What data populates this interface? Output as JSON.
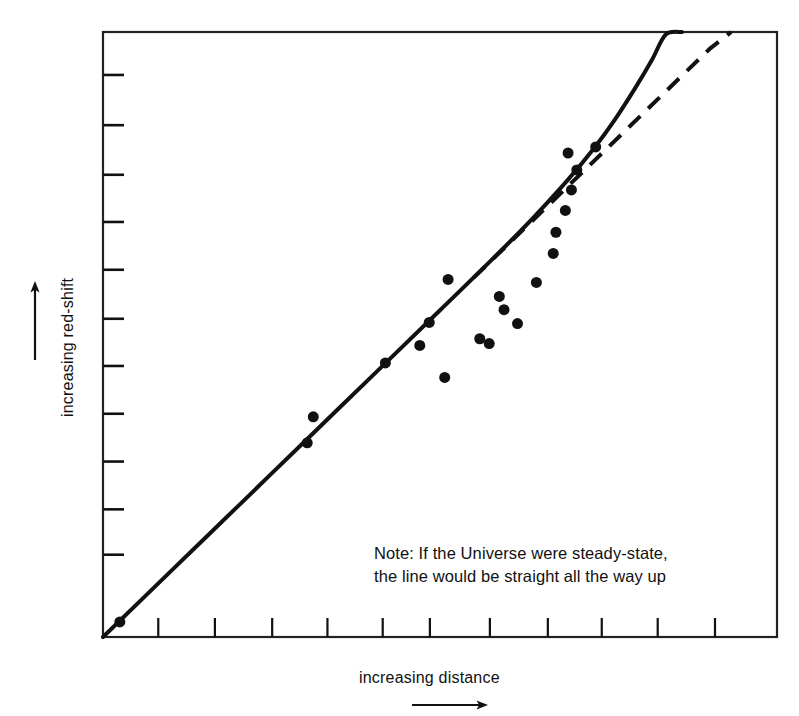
{
  "chart_data": {
    "type": "scatter",
    "title": "",
    "subtitle": "",
    "xlabel": "increasing distance",
    "ylabel": "increasing red-shift",
    "xtick_labels": [],
    "ytick_labels": [],
    "grid": false,
    "legend": null,
    "axis_note": "Axes are unlabeled/qualitative: only direction of increase is indicated by arrows.",
    "xlim": [
      0,
      100
    ],
    "ylim": [
      0,
      100
    ],
    "x_tick_count": 11,
    "y_tick_count": 11,
    "x_tick_positions": [
      8.2,
      16.6,
      25.1,
      33.3,
      41.5,
      48.5,
      57.4,
      66.0,
      74.0,
      82.3,
      90.8
    ],
    "y_tick_positions": [
      92.9,
      84.6,
      76.4,
      68.6,
      60.7,
      52.6,
      44.8,
      36.9,
      29.0,
      21.1,
      13.6
    ],
    "annotations": [
      {
        "name": "steady-state-note",
        "line1": "Note: If the Universe were steady-state,",
        "line2": "the line would be straight all the way up",
        "x": 41.0,
        "y": 15.0
      }
    ],
    "series": [
      {
        "name": "observed-galaxies",
        "type": "scatter",
        "marker": "filled-circle",
        "marker_size_px": 11,
        "color": "#111111",
        "points": [
          [
            2.5,
            2.5
          ],
          [
            30.3,
            32.1
          ],
          [
            31.2,
            36.4
          ],
          [
            41.9,
            45.3
          ],
          [
            48.4,
            52.0
          ],
          [
            47.0,
            48.2
          ],
          [
            50.7,
            42.9
          ],
          [
            51.2,
            59.1
          ],
          [
            55.9,
            49.3
          ],
          [
            57.3,
            48.5
          ],
          [
            58.8,
            56.3
          ],
          [
            59.5,
            54.1
          ],
          [
            61.5,
            51.8
          ],
          [
            64.3,
            58.6
          ],
          [
            67.2,
            66.9
          ],
          [
            68.6,
            70.5
          ],
          [
            69.5,
            73.9
          ],
          [
            70.3,
            77.2
          ],
          [
            69.0,
            80.0
          ],
          [
            73.1,
            81.0
          ],
          [
            66.8,
            63.4
          ]
        ]
      },
      {
        "name": "observed-curve-decelerating",
        "type": "line",
        "style": "solid",
        "color": "#111111",
        "width_px": 4,
        "description": "Observed relation: bends upward away from a straight line at large distance",
        "points": [
          [
            0.0,
            0.0
          ],
          [
            10.0,
            10.8
          ],
          [
            20.0,
            21.6
          ],
          [
            30.0,
            32.4
          ],
          [
            40.0,
            43.2
          ],
          [
            50.0,
            54.0
          ],
          [
            58.0,
            62.7
          ],
          [
            64.0,
            69.5
          ],
          [
            69.0,
            75.6
          ],
          [
            73.0,
            81.0
          ],
          [
            76.0,
            85.6
          ],
          [
            79.0,
            90.8
          ],
          [
            81.5,
            95.5
          ],
          [
            83.5,
            99.6
          ],
          [
            85.9,
            100.0
          ]
        ]
      },
      {
        "name": "steady-state-line-straight",
        "type": "line",
        "style": "dashed",
        "color": "#111111",
        "width_px": 4,
        "dash_pattern": "16 11",
        "description": "Straight extrapolation expected in a steady-state universe",
        "points": [
          [
            0.0,
            0.0
          ],
          [
            30.0,
            32.4
          ],
          [
            55.0,
            59.4
          ],
          [
            70.0,
            75.6
          ],
          [
            80.0,
            86.4
          ],
          [
            90.0,
            97.2
          ],
          [
            93.2,
            100.0
          ]
        ]
      }
    ]
  },
  "axes": {
    "y_axis": {
      "name": "increasing red-shift",
      "label": "increasing red-shift",
      "arrow_direction": "up"
    },
    "x_axis": {
      "name": "increasing distance",
      "label": "increasing distance",
      "arrow_direction": "right"
    }
  },
  "colors": {
    "ink": "#111111",
    "frame": "#222222",
    "background": "#ffffff"
  }
}
